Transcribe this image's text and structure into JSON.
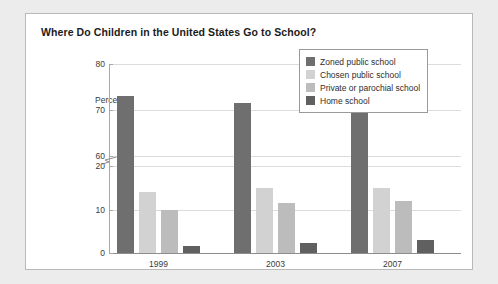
{
  "card": {
    "title": "Where Do Children in the United States Go to School?"
  },
  "chart_data": {
    "type": "bar",
    "title": "Where Do Children in the United States Go to School?",
    "xlabel": "",
    "ylabel": "Percent",
    "categories": [
      "1999",
      "2003",
      "2007"
    ],
    "series": [
      {
        "name": "Zoned public school",
        "values": [
          73,
          71.5,
          70.5
        ],
        "color": "#6f6f6f"
      },
      {
        "name": "Chosen public school",
        "values": [
          14,
          15,
          15
        ],
        "color": "#d2d2d2"
      },
      {
        "name": "Private or parochial school",
        "values": [
          10,
          11.5,
          12
        ],
        "color": "#bcbcbc"
      },
      {
        "name": "Home school",
        "values": [
          1.7,
          2.4,
          3
        ],
        "color": "#606060"
      }
    ],
    "ylim": [
      0,
      80
    ],
    "yticks": [
      0,
      10,
      20,
      60,
      70,
      80
    ],
    "ytick_labels": [
      "0",
      "10",
      "20",
      "60",
      "70",
      "80"
    ],
    "axis_break": {
      "present": true,
      "between": [
        20,
        60
      ]
    },
    "grid": true,
    "legend_position": "upper right"
  }
}
